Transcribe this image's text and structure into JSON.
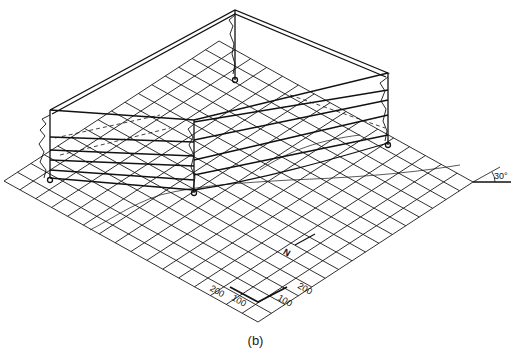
{
  "figure": {
    "caption": "(b)",
    "angle_label": "30°",
    "north_label": "N",
    "scale": {
      "left_labels": [
        "200",
        "100"
      ],
      "right_labels": [
        "100",
        "200"
      ]
    },
    "grid": {
      "left": [
        4,
        181
      ],
      "bottom": [
        258,
        322
      ],
      "right": [
        473,
        182
      ],
      "cols": 16,
      "rows": 16
    },
    "wells": [
      {
        "name": "back",
        "x": 235,
        "top": 10,
        "bottom": 80
      },
      {
        "name": "left",
        "x": 50,
        "top": 110,
        "bottom": 178
      },
      {
        "name": "front",
        "x": 194,
        "top": 120,
        "bottom": 193
      },
      {
        "name": "right",
        "x": 388,
        "top": 73,
        "bottom": 145
      }
    ],
    "colors": {
      "line": "#1a1a1a",
      "background": "#ffffff"
    }
  }
}
